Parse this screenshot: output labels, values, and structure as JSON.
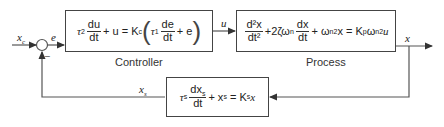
{
  "diagram": {
    "type": "feedback-control-block-diagram",
    "signals": {
      "setpoint": "x",
      "setpoint_sub": "c",
      "error": "e",
      "control": "u",
      "output": "x",
      "measured": "x",
      "measured_sub": "s",
      "feedback_sign": "−"
    },
    "blocks": {
      "controller": {
        "label": "Controller",
        "equation_text": "τ2 du/dt + u = Kc (τ1 de/dt + e)",
        "tau": "τ",
        "tau2_sub": "2",
        "du": "du",
        "dt": "dt",
        "plus_u": "+ u = K",
        "kc_sub": "c",
        "tau1_sub": "1",
        "de": "de",
        "plus_e": "+ e"
      },
      "process": {
        "label": "Process",
        "equation_text": "d²x/dt² + 2ζωn dx/dt + ωn² x = Kp ωn² u",
        "d2x": "d²x",
        "dt2": "dt²",
        "damping": "+2ζω",
        "n_sub": "n",
        "dx": "dx",
        "dt": "dt",
        "plus_omega": "+ ω",
        "x_eq": "x = K",
        "p_sub": "p",
        "omega": "ω",
        "sq": "2",
        "u": "u"
      },
      "sensor": {
        "equation_text": "τs dxs/dt + xs = Ks x",
        "tau": "τ",
        "s_sub": "s",
        "dxs": "dx",
        "dt": "dt",
        "plus_xs": "+ x",
        "eq_k": "= K",
        "x": "x"
      }
    },
    "colors": {
      "line": "#444444",
      "text": "#222222",
      "background": "#ffffff"
    }
  }
}
